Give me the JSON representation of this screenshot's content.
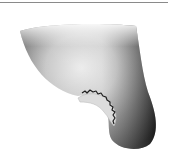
{
  "image": {
    "description": "grayscale shaded illustration of a rounded conical shape with a notched crescent cut-out",
    "colors": {
      "background": "#ffffff",
      "dark_shade": "#2a2a2a",
      "light_shade": "#e6e6e6",
      "rule": "#8a8a8a"
    }
  }
}
